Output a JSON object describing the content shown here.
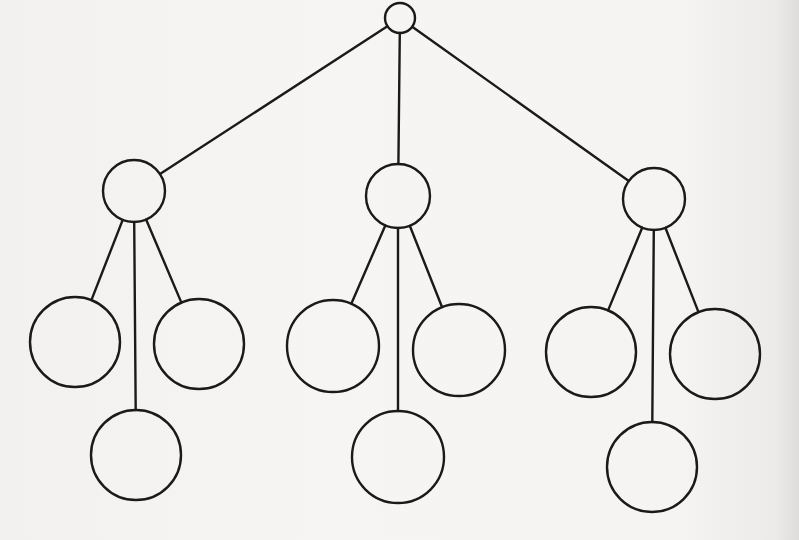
{
  "diagram": {
    "type": "tree",
    "stroke_color": "#1a1a1a",
    "background_color": "#f4f3f1",
    "nodes": [
      {
        "id": "root",
        "level": 0,
        "cx": 400,
        "cy": 18,
        "r": 15
      },
      {
        "id": "n1",
        "level": 1,
        "parent": "root",
        "cx": 134,
        "cy": 191,
        "r": 31
      },
      {
        "id": "n2",
        "level": 1,
        "parent": "root",
        "cx": 398,
        "cy": 196,
        "r": 32
      },
      {
        "id": "n3",
        "level": 1,
        "parent": "root",
        "cx": 654,
        "cy": 199,
        "r": 31
      },
      {
        "id": "n1a",
        "level": 2,
        "parent": "n1",
        "cx": 75,
        "cy": 342,
        "r": 45
      },
      {
        "id": "n1b",
        "level": 2,
        "parent": "n1",
        "cx": 136,
        "cy": 455,
        "r": 45
      },
      {
        "id": "n1c",
        "level": 2,
        "parent": "n1",
        "cx": 199,
        "cy": 344,
        "r": 45
      },
      {
        "id": "n2a",
        "level": 2,
        "parent": "n2",
        "cx": 333,
        "cy": 346,
        "r": 46
      },
      {
        "id": "n2b",
        "level": 2,
        "parent": "n2",
        "cx": 398,
        "cy": 457,
        "r": 46
      },
      {
        "id": "n2c",
        "level": 2,
        "parent": "n2",
        "cx": 459,
        "cy": 350,
        "r": 46
      },
      {
        "id": "n3a",
        "level": 2,
        "parent": "n3",
        "cx": 591,
        "cy": 352,
        "r": 45
      },
      {
        "id": "n3b",
        "level": 2,
        "parent": "n3",
        "cx": 652,
        "cy": 467,
        "r": 45
      },
      {
        "id": "n3c",
        "level": 2,
        "parent": "n3",
        "cx": 715,
        "cy": 354,
        "r": 45
      }
    ],
    "edges": [
      [
        "root",
        "n1"
      ],
      [
        "root",
        "n2"
      ],
      [
        "root",
        "n3"
      ],
      [
        "n1",
        "n1a"
      ],
      [
        "n1",
        "n1b"
      ],
      [
        "n1",
        "n1c"
      ],
      [
        "n2",
        "n2a"
      ],
      [
        "n2",
        "n2b"
      ],
      [
        "n2",
        "n2c"
      ],
      [
        "n3",
        "n3a"
      ],
      [
        "n3",
        "n3b"
      ],
      [
        "n3",
        "n3c"
      ]
    ],
    "node_count": 13,
    "levels": 3,
    "branching_factor": 3
  }
}
